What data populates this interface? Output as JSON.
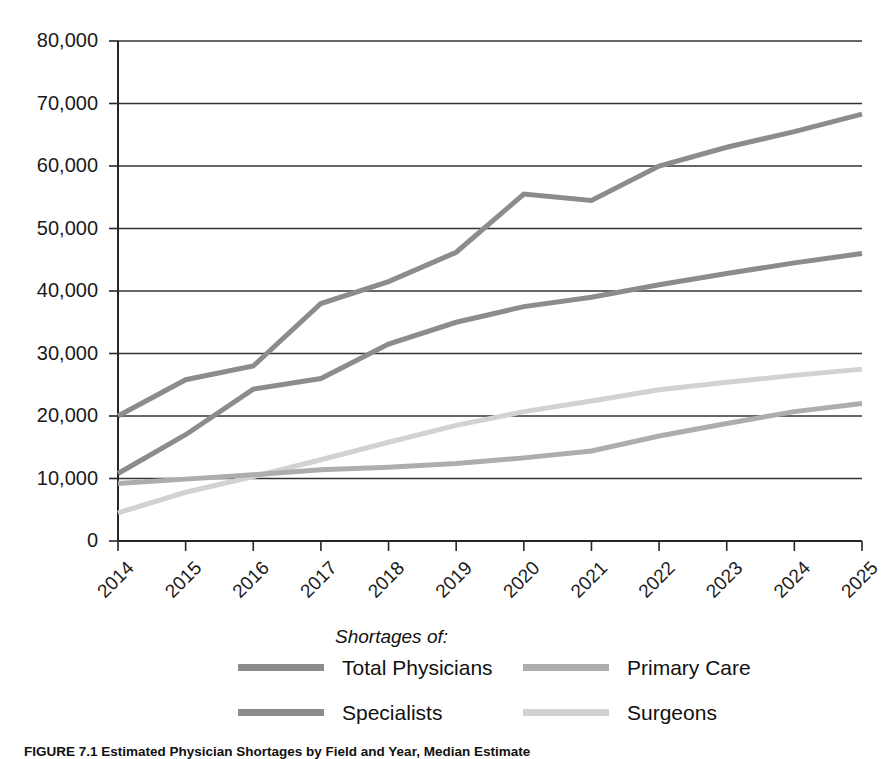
{
  "chart_data": {
    "type": "line",
    "title": "",
    "xlabel": "",
    "ylabel": "",
    "categories": [
      "2014",
      "2015",
      "2016",
      "2017",
      "2018",
      "2019",
      "2020",
      "2021",
      "2022",
      "2023",
      "2024",
      "2025"
    ],
    "ylim": [
      0,
      80000
    ],
    "ytick_values": [
      0,
      10000,
      20000,
      30000,
      40000,
      50000,
      60000,
      70000,
      80000
    ],
    "ytick_labels": [
      "0",
      "10,000",
      "20,000",
      "30,000",
      "40,000",
      "50,000",
      "60,000",
      "70,000",
      "80,000"
    ],
    "grid": true,
    "legend_position": "bottom",
    "legend_title": "Shortages of:",
    "series": [
      {
        "name": "Total Physicians",
        "color": "#8c8c8c",
        "width": 5,
        "values": [
          20000,
          25800,
          28000,
          38000,
          41500,
          46200,
          55500,
          54500,
          60000,
          63000,
          65500,
          68300
        ]
      },
      {
        "name": "Specialists",
        "color": "#8c8c8c",
        "width": 5,
        "values": [
          10800,
          17000,
          24300,
          26000,
          31500,
          35000,
          37500,
          39000,
          41000,
          42800,
          44500,
          46000
        ]
      },
      {
        "name": "Primary Care",
        "color": "#adadad",
        "width": 5,
        "values": [
          9200,
          9900,
          10600,
          11400,
          11800,
          12400,
          13300,
          14400,
          16800,
          18800,
          20700,
          22000
        ]
      },
      {
        "name": "Surgeons",
        "color": "#d2d2d2",
        "width": 5,
        "values": [
          4500,
          7800,
          10300,
          13000,
          15800,
          18500,
          20700,
          22400,
          24200,
          25400,
          26500,
          27500
        ]
      }
    ]
  },
  "legend": {
    "title": "Shortages of:",
    "entries": [
      {
        "label": "Total Physicians",
        "color": "#8c8c8c"
      },
      {
        "label": "Specialists",
        "color": "#8c8c8c"
      },
      {
        "label": "Primary Care",
        "color": "#adadad"
      },
      {
        "label": "Surgeons",
        "color": "#d2d2d2"
      }
    ]
  },
  "caption": {
    "text": "FIGURE 7.1 Estimated Physician Shortages by Field and Year, Median Estimate"
  }
}
